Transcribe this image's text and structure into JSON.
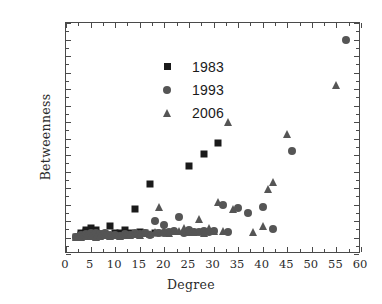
{
  "chart_data": {
    "type": "scatter",
    "title": "",
    "xlabel": "Degree",
    "ylabel": "Betweenness",
    "xlim": [
      0,
      60
    ],
    "ylim": [
      -200,
      2600
    ],
    "xticks": [
      0,
      5,
      10,
      15,
      20,
      25,
      30,
      35,
      40,
      45,
      50,
      55,
      60
    ],
    "yticks": [
      -200,
      0,
      200,
      400,
      600,
      800,
      1000,
      1200,
      1400,
      1600,
      1800,
      2000,
      2200,
      2400,
      2600
    ],
    "grid": false,
    "legend_position": "upper-left-inside",
    "series": [
      {
        "name": "1983",
        "marker": "square",
        "color": "#1a1a1a",
        "points": [
          [
            2,
            10
          ],
          [
            3,
            25
          ],
          [
            3,
            60
          ],
          [
            4,
            70
          ],
          [
            4,
            95
          ],
          [
            5,
            120
          ],
          [
            5,
            60
          ],
          [
            6,
            55
          ],
          [
            6,
            90
          ],
          [
            7,
            40
          ],
          [
            8,
            45
          ],
          [
            9,
            140
          ],
          [
            10,
            50
          ],
          [
            11,
            55
          ],
          [
            12,
            95
          ],
          [
            13,
            60
          ],
          [
            14,
            340
          ],
          [
            15,
            70
          ],
          [
            16,
            60
          ],
          [
            17,
            645
          ],
          [
            18,
            55
          ],
          [
            25,
            865
          ],
          [
            28,
            1010
          ],
          [
            31,
            1150
          ]
        ]
      },
      {
        "name": "1993",
        "marker": "circle",
        "color": "#555555",
        "points": [
          [
            2,
            8
          ],
          [
            3,
            12
          ],
          [
            3,
            30
          ],
          [
            4,
            18
          ],
          [
            4,
            45
          ],
          [
            5,
            25
          ],
          [
            5,
            55
          ],
          [
            6,
            20
          ],
          [
            6,
            50
          ],
          [
            7,
            15
          ],
          [
            7,
            40
          ],
          [
            8,
            30
          ],
          [
            8,
            60
          ],
          [
            9,
            25
          ],
          [
            10,
            35
          ],
          [
            11,
            20
          ],
          [
            12,
            45
          ],
          [
            13,
            30
          ],
          [
            14,
            55
          ],
          [
            15,
            40
          ],
          [
            16,
            60
          ],
          [
            17,
            35
          ],
          [
            18,
            200
          ],
          [
            19,
            50
          ],
          [
            20,
            150
          ],
          [
            20,
            60
          ],
          [
            21,
            70
          ],
          [
            22,
            75
          ],
          [
            23,
            245
          ],
          [
            24,
            60
          ],
          [
            25,
            85
          ],
          [
            26,
            70
          ],
          [
            27,
            65
          ],
          [
            28,
            80
          ],
          [
            28,
            60
          ],
          [
            29,
            70
          ],
          [
            30,
            75
          ],
          [
            32,
            400
          ],
          [
            33,
            70
          ],
          [
            35,
            355
          ],
          [
            37,
            300
          ],
          [
            40,
            375
          ],
          [
            42,
            100
          ],
          [
            46,
            1050
          ],
          [
            57,
            2400
          ]
        ]
      },
      {
        "name": "2006",
        "marker": "triangle",
        "color": "#555555",
        "points": [
          [
            2,
            5
          ],
          [
            3,
            10
          ],
          [
            4,
            15
          ],
          [
            5,
            20
          ],
          [
            6,
            12
          ],
          [
            7,
            18
          ],
          [
            8,
            25
          ],
          [
            9,
            15
          ],
          [
            10,
            30
          ],
          [
            11,
            20
          ],
          [
            12,
            35
          ],
          [
            13,
            25
          ],
          [
            14,
            40
          ],
          [
            15,
            30
          ],
          [
            16,
            50
          ],
          [
            17,
            45
          ],
          [
            18,
            70
          ],
          [
            19,
            375
          ],
          [
            20,
            95
          ],
          [
            21,
            60
          ],
          [
            22,
            75
          ],
          [
            23,
            80
          ],
          [
            24,
            120
          ],
          [
            25,
            70
          ],
          [
            26,
            65
          ],
          [
            27,
            230
          ],
          [
            28,
            60
          ],
          [
            29,
            110
          ],
          [
            30,
            80
          ],
          [
            31,
            430
          ],
          [
            32,
            75
          ],
          [
            33,
            1400
          ],
          [
            34,
            340
          ],
          [
            38,
            70
          ],
          [
            40,
            140
          ],
          [
            41,
            590
          ],
          [
            42,
            670
          ],
          [
            45,
            1250
          ],
          [
            55,
            1850
          ]
        ]
      }
    ]
  },
  "legend": {
    "entries": [
      {
        "label": "1983",
        "marker": "square"
      },
      {
        "label": "1993",
        "marker": "circle"
      },
      {
        "label": "2006",
        "marker": "triangle"
      }
    ]
  }
}
